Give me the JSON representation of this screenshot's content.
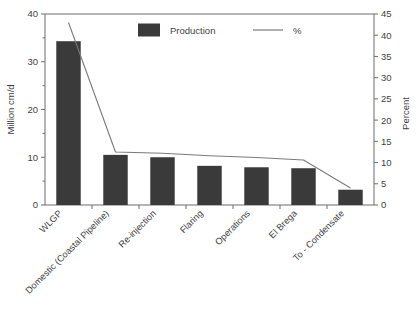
{
  "chart_data": {
    "type": "bar",
    "title": "",
    "subtitle": "",
    "categories": [
      "WLGP",
      "Domestic (Coastal Pipeline)",
      "Re-injection",
      "Flaring",
      "Operations",
      "El Brega",
      "To - Condensate"
    ],
    "series": [
      {
        "name": "Production",
        "axis": "left",
        "render": "bar",
        "values": [
          34.3,
          10.5,
          10.0,
          8.2,
          7.9,
          7.7,
          3.2
        ]
      },
      {
        "name": "%",
        "axis": "right",
        "render": "line",
        "values": [
          43.0,
          12.5,
          12.2,
          11.6,
          11.2,
          10.6,
          4.0
        ]
      }
    ],
    "ylabel": "Million cm/d",
    "ylim": [
      0,
      40
    ],
    "yticks": [
      0,
      10,
      20,
      30,
      40
    ],
    "yticklabels": [
      "0",
      "10",
      "20",
      "30",
      "40"
    ],
    "y_minor_ticks": [
      5,
      15,
      25,
      35
    ],
    "y2label": "Percent",
    "y2lim": [
      0,
      45
    ],
    "y2ticks": [
      0,
      5,
      10,
      15,
      20,
      25,
      30,
      35,
      40,
      45
    ],
    "y2ticklabels": [
      "0",
      "5",
      "10",
      "15",
      "20",
      "25",
      "30",
      "35",
      "40",
      "45"
    ],
    "xlabel": "",
    "grid": false,
    "legend_position": "top-center",
    "legend": [
      {
        "label": "Production",
        "marker": "square",
        "color": "#3a3a3a"
      },
      {
        "label": "%",
        "marker": "line",
        "color": "#7a7a7a"
      }
    ],
    "colors": {
      "bar": "#3a3a3a",
      "line": "#7a7a7a",
      "axis": "#6d6d6d",
      "text": "#3f3f3f",
      "background": "#ffffff"
    }
  },
  "caption": {
    "text": ""
  }
}
